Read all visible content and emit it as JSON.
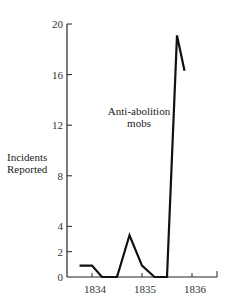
{
  "chart_data": {
    "type": "line",
    "title": "",
    "xlabel": "",
    "ylabel": "Incidents Reported",
    "ylabel_lines": [
      "Incidents",
      "Reported"
    ],
    "annotation_lines": [
      "Anti-abolition",
      "mobs"
    ],
    "xlim": [
      1833.7,
      1836.5
    ],
    "ylim": [
      0,
      20
    ],
    "grid": false,
    "legend": "none",
    "x_ticks": [
      1834,
      1835,
      1836
    ],
    "x_tick_labels": [
      "1834",
      "1835",
      "1836"
    ],
    "y_ticks": [
      0,
      2,
      4,
      8,
      12,
      16,
      20
    ],
    "y_tick_labels": [
      "0",
      "2",
      "4",
      "8",
      "12",
      "16",
      "20"
    ],
    "series": [
      {
        "name": "Anti-abolition mobs",
        "x": [
          1833.75,
          1834.0,
          1834.2,
          1834.5,
          1834.75,
          1835.0,
          1835.25,
          1835.5,
          1835.7,
          1835.85
        ],
        "values": [
          0.9,
          0.9,
          0,
          0,
          3.3,
          0.9,
          0,
          0,
          19.1,
          16.3
        ]
      }
    ]
  }
}
